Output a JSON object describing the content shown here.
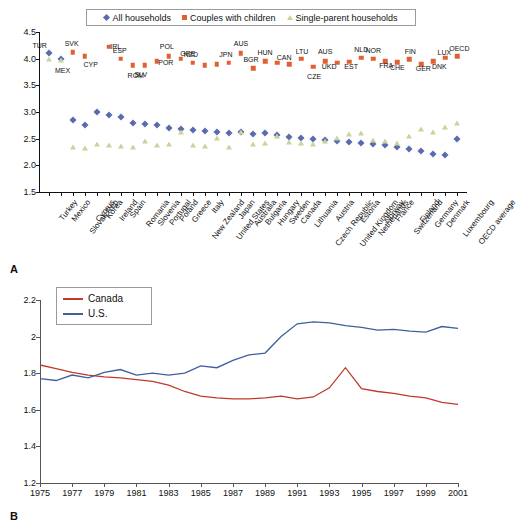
{
  "figure": {
    "panel_a_letter": "A",
    "panel_b_letter": "B"
  },
  "chart_data": [
    {
      "type": "scatter",
      "panel": "A",
      "title": "",
      "xlabel": "",
      "ylabel": "",
      "ylim": [
        1.5,
        4.5
      ],
      "yticks": [
        "1.5",
        "2.0",
        "2.5",
        "3.0",
        "3.5",
        "4.0",
        "4.5"
      ],
      "grid": false,
      "legend_position": "top",
      "legend": [
        "All households",
        "Couples with children",
        "Single-parent households"
      ],
      "categories": [
        "Turkey",
        "Mexico",
        "Slovak Rep",
        "Cyprus",
        "Korea",
        "Ireland",
        "Spain",
        "Romania",
        "Slovenia",
        "Portugal",
        "Poland",
        "Greece",
        "New Zealand",
        "Italy",
        "United States",
        "Japan",
        "Australia",
        "Bulgaria",
        "Hungary",
        "Sweden",
        "Canada",
        "Lithuania",
        "Czech Republic",
        "Austria",
        "United Kingdom",
        "Estonia",
        "Netherlands",
        "Norway",
        "France",
        "Switzerland",
        "Finland",
        "Germany",
        "Denmark",
        "Luxembourg",
        "OECD average"
      ],
      "series": [
        {
          "name": "All households",
          "marker": "diamond",
          "color": "#5b6bb0",
          "values": [
            4.11,
            4.0,
            2.85,
            2.76,
            3.0,
            2.95,
            2.9,
            2.8,
            2.78,
            2.75,
            2.7,
            2.68,
            2.66,
            2.64,
            2.62,
            2.6,
            2.62,
            2.58,
            2.6,
            2.56,
            2.54,
            2.52,
            2.5,
            2.48,
            2.46,
            2.44,
            2.42,
            2.4,
            2.38,
            2.34,
            2.3,
            2.26,
            2.22,
            2.2,
            2.5
          ]
        },
        {
          "name": "Couples with children",
          "marker": "square",
          "color": "#e06030",
          "values": [
            null,
            null,
            4.12,
            4.05,
            null,
            4.22,
            4.0,
            3.88,
            3.88,
            3.95,
            4.05,
            4.0,
            3.92,
            3.88,
            3.9,
            3.92,
            4.1,
            3.82,
            3.95,
            3.92,
            3.9,
            4.0,
            3.85,
            3.95,
            3.92,
            3.94,
            4.02,
            4.0,
            3.95,
            3.93,
            3.99,
            3.9,
            3.95,
            4.02,
            4.05
          ]
        },
        {
          "name": "Single-parent households",
          "marker": "triangle",
          "color": "#c9d49a",
          "values": [
            4.0,
            3.98,
            2.35,
            2.33,
            2.4,
            2.38,
            2.36,
            2.34,
            2.45,
            2.38,
            2.4,
            2.62,
            2.38,
            2.36,
            2.52,
            2.34,
            2.62,
            2.4,
            2.42,
            2.55,
            2.44,
            2.42,
            2.4,
            2.45,
            2.52,
            2.58,
            2.6,
            2.48,
            2.46,
            2.42,
            2.55,
            2.68,
            2.62,
            2.72,
            2.8
          ]
        }
      ],
      "point_codes": [
        {
          "label": "TUR",
          "category": "Turkey",
          "series": "All households"
        },
        {
          "label": "MEX",
          "category": "Mexico",
          "series": "Single-parent households"
        },
        {
          "label": "SVK",
          "category": "Slovak Rep",
          "series": "Couples with children"
        },
        {
          "label": "CYP",
          "category": "Cyprus",
          "series": "Couples with children"
        },
        {
          "label": "IRL",
          "category": "Ireland",
          "series": "Couples with children"
        },
        {
          "label": "ESP",
          "category": "Spain",
          "series": "Couples with children"
        },
        {
          "label": "ROM",
          "category": "Romania",
          "series": "Couples with children"
        },
        {
          "label": "SLV",
          "category": "Slovenia",
          "series": "Couples with children"
        },
        {
          "label": "POR",
          "category": "Portugal",
          "series": "Couples with children"
        },
        {
          "label": "POL",
          "category": "Poland",
          "series": "Couples with children"
        },
        {
          "label": "GRE",
          "category": "Greece",
          "series": "Couples with children"
        },
        {
          "label": "NZD",
          "category": "New Zealand",
          "series": "Couples with children"
        },
        {
          "label": "JPN",
          "category": "Japan",
          "series": "Couples with children"
        },
        {
          "label": "AUS",
          "category": "Australia",
          "series": "Couples with children"
        },
        {
          "label": "BGR",
          "category": "Bulgaria",
          "series": "Couples with children"
        },
        {
          "label": "HUN",
          "category": "Hungary",
          "series": "Couples with children"
        },
        {
          "label": "CAN",
          "category": "Canada",
          "series": "Couples with children"
        },
        {
          "label": "LTU",
          "category": "Lithuania",
          "series": "Couples with children"
        },
        {
          "label": "CZE",
          "category": "Czech Republic",
          "series": "Couples with children"
        },
        {
          "label": "AUS",
          "category": "Austria",
          "series": "Couples with children"
        },
        {
          "label": "UKD",
          "category": "United Kingdom",
          "series": "Couples with children"
        },
        {
          "label": "EST",
          "category": "Estonia",
          "series": "Couples with children"
        },
        {
          "label": "NLD",
          "category": "Netherlands",
          "series": "Couples with children"
        },
        {
          "label": "NOR",
          "category": "Norway",
          "series": "Couples with children"
        },
        {
          "label": "FRA",
          "category": "France",
          "series": "Couples with children"
        },
        {
          "label": "CHE",
          "category": "Switzerland",
          "series": "Couples with children"
        },
        {
          "label": "FIN",
          "category": "Finland",
          "series": "Couples with children"
        },
        {
          "label": "GER",
          "category": "Germany",
          "series": "Couples with children"
        },
        {
          "label": "DNK",
          "category": "Denmark",
          "series": "Couples with children"
        },
        {
          "label": "LUX",
          "category": "Luxembourg",
          "series": "Couples with children"
        },
        {
          "label": "OECD",
          "category": "OECD average",
          "series": "Couples with children"
        }
      ]
    },
    {
      "type": "line",
      "panel": "B",
      "title": "",
      "xlabel": "",
      "ylabel": "",
      "ylim": [
        1.2,
        2.2
      ],
      "yticks": [
        "1.2",
        "1.4",
        "1.6",
        "1.8",
        "2",
        "2.2"
      ],
      "xlim": [
        1975,
        2001
      ],
      "xticks": [
        "1975",
        "1977",
        "1979",
        "1981",
        "1983",
        "1985",
        "1987",
        "1989",
        "1991",
        "1993",
        "1995",
        "1997",
        "1999",
        "2001"
      ],
      "grid": false,
      "legend_position": "top-left",
      "x": [
        1975,
        1976,
        1977,
        1978,
        1979,
        1980,
        1981,
        1982,
        1983,
        1984,
        1985,
        1986,
        1987,
        1988,
        1989,
        1990,
        1991,
        1992,
        1993,
        1994,
        1995,
        1996,
        1997,
        1998,
        1999,
        2000,
        2001
      ],
      "series": [
        {
          "name": "Canada",
          "color": "#c0392b",
          "values": [
            1.845,
            1.825,
            1.805,
            1.79,
            1.78,
            1.775,
            1.765,
            1.755,
            1.735,
            1.7,
            1.675,
            1.665,
            1.66,
            1.66,
            1.665,
            1.675,
            1.66,
            1.67,
            1.72,
            1.83,
            1.715,
            1.7,
            1.69,
            1.675,
            1.665,
            1.64,
            1.63
          ]
        },
        {
          "name": "U.S.",
          "color": "#3f5f9e",
          "values": [
            1.77,
            1.76,
            1.79,
            1.775,
            1.805,
            1.82,
            1.79,
            1.8,
            1.79,
            1.8,
            1.84,
            1.83,
            1.87,
            1.9,
            1.91,
            2.0,
            2.07,
            2.08,
            2.075,
            2.06,
            2.05,
            2.035,
            2.04,
            2.03,
            2.025,
            2.055,
            2.045
          ]
        }
      ]
    }
  ]
}
